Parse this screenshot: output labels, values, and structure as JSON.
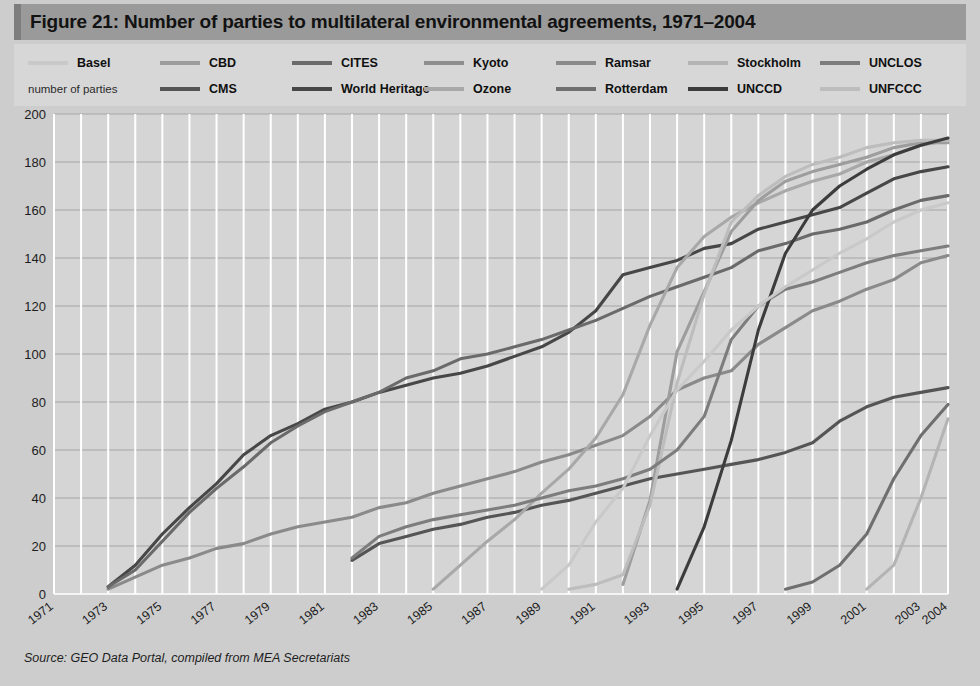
{
  "figure": {
    "title": "Figure 21: Number of parties to multilateral environmental agreements, 1971–2004",
    "source": "Source: GEO Data Portal, compiled from MEA Secretariats",
    "axis_caption": "number of parties",
    "title_bar_color": "#9a9a9a",
    "legend_bg_color": "#d7d7d7",
    "plot_bg_color": "#d5d5d5",
    "gridline_color": "#ffffff"
  },
  "legend": {
    "row1": [
      {
        "label": "Basel",
        "color": "#c9c9c9"
      },
      {
        "label": "CBD",
        "color": "#9d9d9d"
      },
      {
        "label": "CITES",
        "color": "#6a6a6a"
      },
      {
        "label": "Kyoto",
        "color": "#8e8e8e"
      },
      {
        "label": "Ramsar",
        "color": "#8a8a8a"
      },
      {
        "label": "Stockholm",
        "color": "#b4b4b4"
      },
      {
        "label": "UNCLOS",
        "color": "#7d7d7d"
      }
    ],
    "row2": [
      {
        "label": "CMS",
        "color": "#555555"
      },
      {
        "label": "World Heritage",
        "color": "#474747"
      },
      {
        "label": "Ozone",
        "color": "#a8a8a8"
      },
      {
        "label": "Rotterdam",
        "color": "#6f6f6f"
      },
      {
        "label": "UNCCD",
        "color": "#3c3c3c"
      },
      {
        "label": "UNFCCC",
        "color": "#bdbdbd"
      }
    ]
  },
  "chart_data": {
    "type": "line",
    "title": "Figure 21: Number of parties to multilateral environmental agreements, 1971–2004",
    "xlabel": "",
    "ylabel": "number of parties",
    "ylim": [
      0,
      200
    ],
    "ytick_step": 20,
    "yticks": [
      0,
      20,
      40,
      60,
      80,
      100,
      120,
      140,
      160,
      180,
      200
    ],
    "xlim": [
      1971,
      2004
    ],
    "xticks": [
      1971,
      1973,
      1975,
      1977,
      1979,
      1981,
      1983,
      1985,
      1987,
      1989,
      1991,
      1993,
      1995,
      1997,
      1999,
      2001,
      2003,
      2004
    ],
    "grid": true,
    "legend_position": "top",
    "x": [
      1971,
      1972,
      1973,
      1974,
      1975,
      1976,
      1977,
      1978,
      1979,
      1980,
      1981,
      1982,
      1983,
      1984,
      1985,
      1986,
      1987,
      1988,
      1989,
      1990,
      1991,
      1992,
      1993,
      1994,
      1995,
      1996,
      1997,
      1998,
      1999,
      2000,
      2001,
      2002,
      2003,
      2004
    ],
    "series": [
      {
        "name": "Ramsar",
        "color": "#8a8a8a",
        "start_year": 1973,
        "values": [
          null,
          null,
          2,
          7,
          12,
          15,
          19,
          21,
          25,
          28,
          30,
          32,
          36,
          38,
          42,
          45,
          48,
          51,
          55,
          58,
          62,
          66,
          74,
          85,
          90,
          93,
          104,
          111,
          118,
          122,
          127,
          131,
          138,
          141
        ]
      },
      {
        "name": "World Heritage",
        "color": "#474747",
        "start_year": 1973,
        "values": [
          null,
          null,
          3,
          12,
          25,
          36,
          46,
          58,
          66,
          71,
          77,
          80,
          84,
          87,
          90,
          92,
          95,
          99,
          103,
          109,
          118,
          133,
          136,
          139,
          144,
          146,
          152,
          155,
          158,
          161,
          167,
          173,
          176,
          178
        ]
      },
      {
        "name": "CITES",
        "color": "#6a6a6a",
        "start_year": 1973,
        "values": [
          null,
          null,
          3,
          10,
          22,
          34,
          44,
          53,
          63,
          70,
          76,
          80,
          84,
          90,
          93,
          98,
          100,
          103,
          106,
          110,
          114,
          119,
          124,
          128,
          132,
          136,
          143,
          146,
          150,
          152,
          155,
          160,
          164,
          166
        ]
      },
      {
        "name": "CMS",
        "color": "#555555",
        "start_year": 1982,
        "values": [
          null,
          null,
          null,
          null,
          null,
          null,
          null,
          null,
          null,
          null,
          null,
          14,
          21,
          24,
          27,
          29,
          32,
          34,
          37,
          39,
          42,
          45,
          48,
          50,
          52,
          54,
          56,
          59,
          63,
          72,
          78,
          82,
          84,
          86
        ]
      },
      {
        "name": "Ozone",
        "color": "#a8a8a8",
        "start_year": 1985,
        "values": [
          null,
          null,
          null,
          null,
          null,
          null,
          null,
          null,
          null,
          null,
          null,
          null,
          null,
          null,
          2,
          12,
          22,
          31,
          42,
          52,
          65,
          83,
          112,
          136,
          149,
          157,
          163,
          168,
          172,
          175,
          180,
          183,
          187,
          189
        ]
      },
      {
        "name": "CBD",
        "color": "#9d9d9d",
        "start_year": 1992,
        "values": [
          null,
          null,
          null,
          null,
          null,
          null,
          null,
          null,
          null,
          null,
          null,
          null,
          null,
          null,
          null,
          null,
          null,
          null,
          null,
          null,
          null,
          4,
          39,
          101,
          126,
          151,
          164,
          172,
          176,
          179,
          182,
          186,
          188,
          188
        ]
      },
      {
        "name": "UNFCCC",
        "color": "#bdbdbd",
        "start_year": 1990,
        "values": [
          null,
          null,
          null,
          null,
          null,
          null,
          null,
          null,
          null,
          null,
          null,
          null,
          null,
          null,
          null,
          null,
          null,
          null,
          null,
          2,
          4,
          8,
          37,
          88,
          125,
          155,
          166,
          174,
          179,
          182,
          186,
          188,
          189,
          189
        ]
      },
      {
        "name": "UNCLOS",
        "color": "#7d7d7d",
        "start_year": 1982,
        "values": [
          null,
          null,
          null,
          null,
          null,
          null,
          null,
          null,
          null,
          null,
          null,
          15,
          24,
          28,
          31,
          33,
          35,
          37,
          40,
          43,
          45,
          48,
          52,
          60,
          74,
          106,
          120,
          127,
          130,
          134,
          138,
          141,
          143,
          145
        ]
      },
      {
        "name": "UNCCD",
        "color": "#3c3c3c",
        "start_year": 1994,
        "values": [
          null,
          null,
          null,
          null,
          null,
          null,
          null,
          null,
          null,
          null,
          null,
          null,
          null,
          null,
          null,
          null,
          null,
          null,
          null,
          null,
          null,
          null,
          null,
          2,
          28,
          64,
          110,
          142,
          160,
          170,
          177,
          183,
          187,
          190
        ]
      },
      {
        "name": "Basel",
        "color": "#c9c9c9",
        "start_year": 1989,
        "values": [
          null,
          null,
          null,
          null,
          null,
          null,
          null,
          null,
          null,
          null,
          null,
          null,
          null,
          null,
          null,
          null,
          null,
          null,
          2,
          12,
          30,
          44,
          66,
          85,
          97,
          110,
          120,
          128,
          135,
          142,
          148,
          155,
          160,
          163
        ]
      },
      {
        "name": "Rotterdam",
        "color": "#6f6f6f",
        "start_year": 1998,
        "values": [
          null,
          null,
          null,
          null,
          null,
          null,
          null,
          null,
          null,
          null,
          null,
          null,
          null,
          null,
          null,
          null,
          null,
          null,
          null,
          null,
          null,
          null,
          null,
          null,
          null,
          null,
          null,
          2,
          5,
          12,
          25,
          48,
          66,
          79
        ]
      },
      {
        "name": "Stockholm",
        "color": "#b4b4b4",
        "start_year": 2001,
        "values": [
          null,
          null,
          null,
          null,
          null,
          null,
          null,
          null,
          null,
          null,
          null,
          null,
          null,
          null,
          null,
          null,
          null,
          null,
          null,
          null,
          null,
          null,
          null,
          null,
          null,
          null,
          null,
          null,
          null,
          null,
          2,
          12,
          40,
          73
        ]
      }
    ]
  }
}
